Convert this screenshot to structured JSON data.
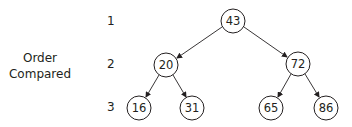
{
  "axis_title": {
    "line1": "Order",
    "line2": "Compared"
  },
  "levels": [
    "1",
    "2",
    "3"
  ],
  "tree": {
    "nodes": [
      {
        "id": "n43",
        "value": "43",
        "level": 1
      },
      {
        "id": "n20",
        "value": "20",
        "level": 2
      },
      {
        "id": "n72",
        "value": "72",
        "level": 2
      },
      {
        "id": "n16",
        "value": "16",
        "level": 3
      },
      {
        "id": "n31",
        "value": "31",
        "level": 3
      },
      {
        "id": "n65",
        "value": "65",
        "level": 3
      },
      {
        "id": "n86",
        "value": "86",
        "level": 3
      }
    ],
    "edges": [
      {
        "from": "43",
        "to": "20"
      },
      {
        "from": "43",
        "to": "72"
      },
      {
        "from": "20",
        "to": "16"
      },
      {
        "from": "20",
        "to": "31"
      },
      {
        "from": "72",
        "to": "65"
      },
      {
        "from": "72",
        "to": "86"
      }
    ]
  },
  "colors": {
    "stroke": "#231f20",
    "background": "#ffffff"
  }
}
